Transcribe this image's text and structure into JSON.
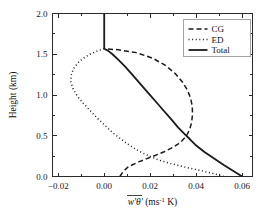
{
  "chart_data": {
    "type": "line",
    "title": "",
    "xlabel": "w'θ' (ms⁻¹ K)",
    "xlabel_parts": {
      "base": "w'θ'",
      "unit_open": " (ms",
      "unit_exp": "-1",
      "unit_close": " K)",
      "overbar": true
    },
    "ylabel": "Height (km)",
    "xlim": [
      -0.0225,
      0.0645
    ],
    "ylim": [
      0.0,
      2.0
    ],
    "xticks": [
      -0.02,
      0.0,
      0.02,
      0.04,
      0.06
    ],
    "xtick_labels": [
      "−0.02",
      "0.00",
      "0.02",
      "0.04",
      "0.06"
    ],
    "xminorticks": [
      -0.01,
      0.01,
      0.03,
      0.05
    ],
    "yticks": [
      0.0,
      0.5,
      1.0,
      1.5,
      2.0
    ],
    "ytick_labels": [
      "0.0",
      "0.5",
      "1.0",
      "1.5",
      "2.0"
    ],
    "yminorticks": [
      0.25,
      0.75,
      1.25,
      1.75
    ],
    "grid": false,
    "legend_position": "upper right",
    "orientation": "x-is-value, y-is-height",
    "series": [
      {
        "name": "CG",
        "style": "dashed",
        "color": "#1a1a1a",
        "width": 1.5,
        "dash": "5,3",
        "points": [
          [
            0.0068,
            0.0
          ],
          [
            0.0082,
            0.06
          ],
          [
            0.0105,
            0.12
          ],
          [
            0.015,
            0.18
          ],
          [
            0.0205,
            0.24
          ],
          [
            0.0258,
            0.3
          ],
          [
            0.03,
            0.36
          ],
          [
            0.0332,
            0.42
          ],
          [
            0.0358,
            0.5
          ],
          [
            0.0372,
            0.58
          ],
          [
            0.038,
            0.66
          ],
          [
            0.0384,
            0.76
          ],
          [
            0.0383,
            0.86
          ],
          [
            0.0376,
            0.96
          ],
          [
            0.0362,
            1.06
          ],
          [
            0.034,
            1.16
          ],
          [
            0.031,
            1.26
          ],
          [
            0.0268,
            1.36
          ],
          [
            0.0212,
            1.45
          ],
          [
            0.014,
            1.52
          ],
          [
            0.0062,
            1.555
          ],
          [
            0.0008,
            1.565
          ],
          [
            0.0,
            1.568
          ]
        ]
      },
      {
        "name": "ED",
        "style": "dotted",
        "color": "#1a1a1a",
        "width": 1.5,
        "dash": "1,2.6",
        "points": [
          [
            0.052,
            0.0
          ],
          [
            0.047,
            0.04
          ],
          [
            0.0408,
            0.08
          ],
          [
            0.0345,
            0.12
          ],
          [
            0.0288,
            0.16
          ],
          [
            0.024,
            0.2
          ],
          [
            0.0196,
            0.25
          ],
          [
            0.0152,
            0.31
          ],
          [
            0.0112,
            0.38
          ],
          [
            0.0072,
            0.46
          ],
          [
            0.0036,
            0.54
          ],
          [
            0.0002,
            0.63
          ],
          [
            -0.0032,
            0.72
          ],
          [
            -0.0062,
            0.81
          ],
          [
            -0.0092,
            0.9
          ],
          [
            -0.0118,
            0.99
          ],
          [
            -0.0136,
            1.08
          ],
          [
            -0.0145,
            1.16
          ],
          [
            -0.0144,
            1.24
          ],
          [
            -0.0134,
            1.32
          ],
          [
            -0.0116,
            1.39
          ],
          [
            -0.0092,
            1.45
          ],
          [
            -0.0062,
            1.5
          ],
          [
            -0.003,
            1.54
          ],
          [
            -0.0008,
            1.562
          ],
          [
            0.0,
            1.568
          ]
        ]
      },
      {
        "name": "Total",
        "style": "solid",
        "color": "#141414",
        "width": 1.8,
        "dash": "",
        "points": [
          [
            0.06,
            0.0
          ],
          [
            0.056,
            0.07
          ],
          [
            0.052,
            0.14
          ],
          [
            0.0478,
            0.22
          ],
          [
            0.0436,
            0.3
          ],
          [
            0.0396,
            0.39
          ],
          [
            0.0372,
            0.46
          ],
          [
            0.035,
            0.52
          ],
          [
            0.0322,
            0.6
          ],
          [
            0.0292,
            0.7
          ],
          [
            0.0258,
            0.81
          ],
          [
            0.0224,
            0.92
          ],
          [
            0.019,
            1.03
          ],
          [
            0.0156,
            1.14
          ],
          [
            0.0122,
            1.25
          ],
          [
            0.009,
            1.35
          ],
          [
            0.0062,
            1.43
          ],
          [
            0.0036,
            1.5
          ],
          [
            0.0016,
            1.545
          ],
          [
            0.0004,
            1.562
          ],
          [
            0.0,
            1.572
          ],
          [
            0.0,
            1.7
          ],
          [
            0.0,
            1.85
          ],
          [
            0.0,
            2.0
          ]
        ]
      }
    ],
    "legend": [
      {
        "label": "CG",
        "style": "dashed",
        "dash": "5,3",
        "width": 1.5
      },
      {
        "label": "ED",
        "style": "dotted",
        "dash": "1,2.6",
        "width": 1.5
      },
      {
        "label": "Total",
        "style": "solid",
        "dash": "",
        "width": 1.8
      }
    ]
  }
}
